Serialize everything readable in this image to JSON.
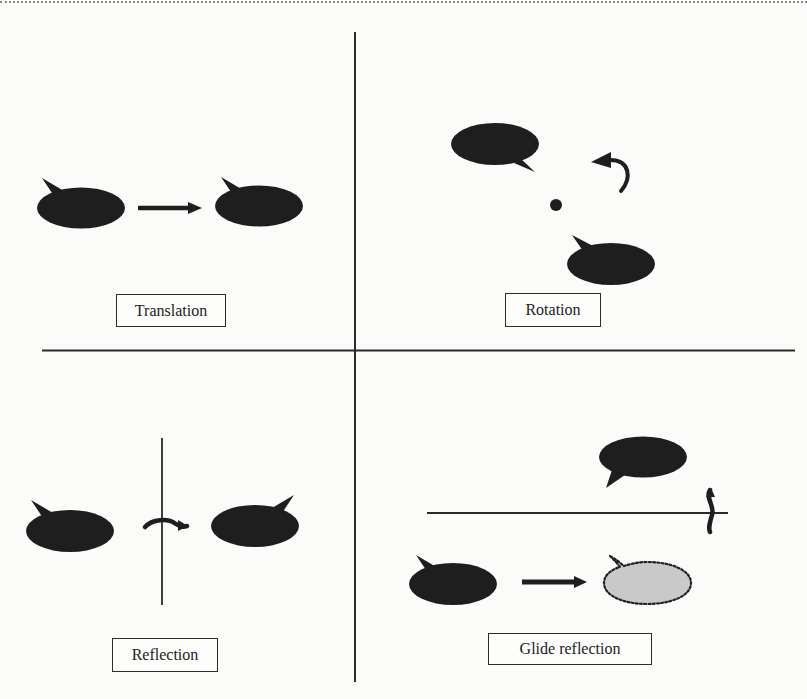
{
  "figure": {
    "quadrants": [
      {
        "id": "translation",
        "label": "Translation"
      },
      {
        "id": "rotation",
        "label": "Rotation"
      },
      {
        "id": "reflection",
        "label": "Reflection"
      },
      {
        "id": "glide_reflection",
        "label": "Glide reflection"
      }
    ],
    "colors": {
      "shape_fill": "#1e1e1e",
      "axis": "#2a2a2a",
      "ghost_fill": "#c9c9c9",
      "ghost_stroke": "#222222",
      "background": "#fbfbfa"
    },
    "icons": [
      "speech-bubble-icon",
      "right-arrow-icon",
      "curved-rotate-arrow-icon",
      "flip-arrow-icon",
      "center-point-icon"
    ]
  }
}
